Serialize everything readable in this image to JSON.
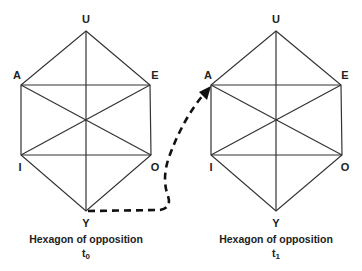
{
  "diagram": {
    "hexagons": [
      {
        "id": "left",
        "caption": "Hexagon of opposition",
        "time_label": "t",
        "time_sub": "0",
        "vertices": {
          "U": {
            "label": "U",
            "x": 86,
            "y": 31
          },
          "A": {
            "label": "A",
            "x": 21,
            "y": 85
          },
          "E": {
            "label": "E",
            "x": 150,
            "y": 85
          },
          "I": {
            "label": "I",
            "x": 21,
            "y": 155
          },
          "O": {
            "label": "O",
            "x": 151,
            "y": 155
          },
          "Y": {
            "label": "Y",
            "x": 86,
            "y": 211
          }
        }
      },
      {
        "id": "right",
        "caption": "Hexagon of opposition",
        "time_label": "t",
        "time_sub": "1",
        "vertices": {
          "U": {
            "label": "U",
            "x": 276,
            "y": 31
          },
          "A": {
            "label": "A",
            "x": 211,
            "y": 85
          },
          "E": {
            "label": "E",
            "x": 341,
            "y": 85
          },
          "I": {
            "label": "I",
            "x": 211,
            "y": 155
          },
          "O": {
            "label": "O",
            "x": 342,
            "y": 155
          },
          "Y": {
            "label": "Y",
            "x": 276,
            "y": 211
          }
        }
      }
    ],
    "transition_arrow": {
      "from": "left.Y",
      "to": "right.A",
      "style": "dashed",
      "color": "#111111"
    },
    "colors": {
      "lines": "#333333",
      "text": "#222222",
      "background": "#ffffff"
    }
  }
}
